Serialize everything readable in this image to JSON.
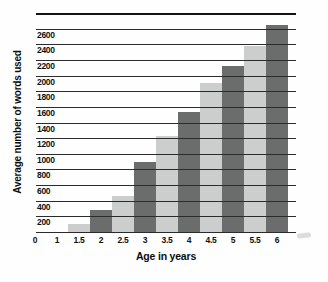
{
  "figure": {
    "background": "#fefefe"
  },
  "chart_data": {
    "type": "bar",
    "title": "",
    "ylabel": "Average number of words used",
    "xlabel": "Age in years",
    "categories": [
      "1.5",
      "2",
      "2.5",
      "3",
      "3.5",
      "4",
      "4.5",
      "5",
      "5.5",
      "6"
    ],
    "values": [
      100,
      280,
      460,
      900,
      1230,
      1540,
      1900,
      2120,
      2380,
      2650
    ],
    "x_tick_labels": [
      "0",
      "1",
      "1.5",
      "2",
      "2.5",
      "3",
      "3.5",
      "4",
      "4.5",
      "5",
      "5.5",
      "6"
    ],
    "y_tick_labels": [
      "0",
      "200",
      "400",
      "600",
      "800",
      "1000",
      "1200",
      "1400",
      "1600",
      "1800",
      "2000",
      "2200",
      "2400",
      "2600"
    ],
    "ylim": [
      0,
      2800
    ],
    "y_step": 200,
    "grid": "horizontal",
    "legend": "none",
    "bar_color_light": "#cccecd",
    "bar_color_dark": "#6b6d6c",
    "gridline_color": "#2b2b2b",
    "bar_pattern": "alternating light/dark starting light at age 1.5"
  }
}
